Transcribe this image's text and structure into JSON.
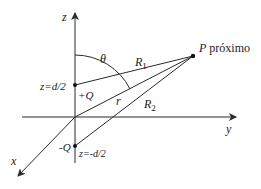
{
  "diagram": {
    "axes": {
      "z_label": "z",
      "y_label": "y",
      "x_label": "x"
    },
    "charges": {
      "positive": {
        "label": "+Q",
        "position_label": "z=d/2"
      },
      "negative": {
        "label": "-Q",
        "position_label": "z=-d/2"
      }
    },
    "point": {
      "label": "P",
      "suffix": "próximo"
    },
    "distances": {
      "R1": {
        "base": "R",
        "sub": "1"
      },
      "R2": {
        "base": "R",
        "sub": "2"
      },
      "r": "r"
    },
    "angle_label": "θ",
    "colors": {
      "line": "#2a2a2a",
      "text": "#1a1a1a",
      "background": "#ffffff"
    }
  }
}
